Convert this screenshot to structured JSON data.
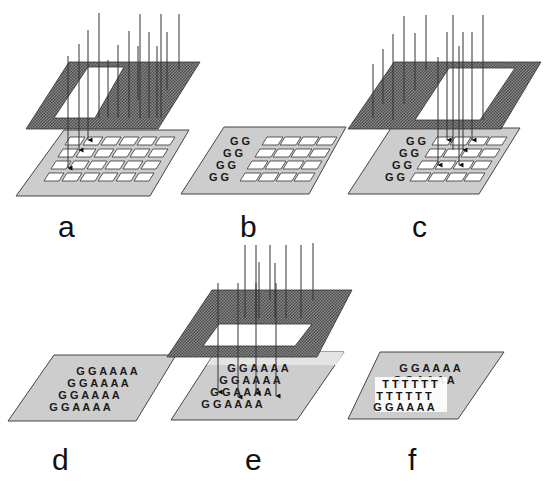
{
  "figure": {
    "header_fragment": "...",
    "colors": {
      "mask": "#6e6e6e",
      "substrate": "#cdcdcd",
      "substrate_edge": "#444444",
      "cell": "#ffffff",
      "beam": "#333333",
      "text": "#111111"
    },
    "panels": [
      {
        "id": "a",
        "label": "a",
        "description": "Mask with window over left columns; light beams deactivate first two columns of the grid"
      },
      {
        "id": "b",
        "label": "b",
        "description": "First two columns coupled with G"
      },
      {
        "id": "c",
        "label": "c",
        "description": "Mask shifted right; light deactivates remaining four columns"
      },
      {
        "id": "d",
        "label": "d",
        "description": "Substrate with rows G G A A A A"
      },
      {
        "id": "e",
        "label": "e",
        "description": "Mask window over front rows; light beams strike substrate"
      },
      {
        "id": "f",
        "label": "f",
        "description": "T strands hybridized to front rows"
      }
    ],
    "sequences": {
      "b_rows": [
        "G G",
        "G G",
        "G G",
        "G G"
      ],
      "d_rows": [
        "G G A A A A",
        "G G A A A A",
        "G G A A A A",
        "G G A A A A"
      ],
      "f_rows_top": [
        "G G A A A A",
        "G G A A A A"
      ],
      "f_rows_T": [
        "T T T T T T",
        "T T T T T T"
      ],
      "f_rows_bottom": [
        "G G A A A A"
      ]
    }
  }
}
